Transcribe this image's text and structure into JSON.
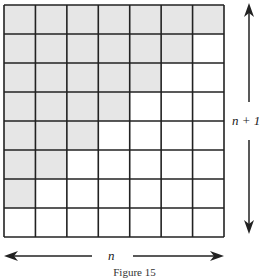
{
  "figure": {
    "caption": "Figure 15",
    "grid": {
      "columns": 7,
      "rows": 8,
      "shaded_per_row": [
        7,
        6,
        5,
        4,
        3,
        2,
        1,
        0
      ],
      "shade_color": "#e6e6e6",
      "line_color": "#222222"
    },
    "labels": {
      "width": "n",
      "height": "n + 1"
    }
  }
}
